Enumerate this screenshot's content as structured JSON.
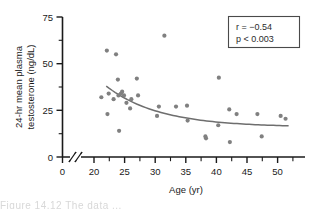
{
  "figure": {
    "background_color": "#ffffff",
    "axis_color": "#1a1a1a",
    "marker_color": "#808080",
    "curve_color": "#6e6e6e",
    "caption_fragment": "Figure  14.12   The data ..."
  },
  "annotation": {
    "name": "stats-box",
    "line1": "r = −0.54",
    "line2": "p < 0.003",
    "r_value": -0.54,
    "p_text": "< 0.003"
  },
  "chart_data": {
    "type": "scatter",
    "title": "",
    "xlabel": "Age (yr)",
    "ylabel": "24-hr mean plasma testosterone (ng/dL)",
    "ylabel_line1": "24-hr mean plasma",
    "ylabel_line2": "testosterone (ng/dL)",
    "xlim": [
      19,
      53
    ],
    "ylim": [
      0,
      75
    ],
    "xticks": [
      20,
      25,
      30,
      35,
      40,
      45,
      50
    ],
    "xtick_labels": [
      "20",
      "25",
      "30",
      "35",
      "40",
      "45",
      "50"
    ],
    "x_origin_label": "0",
    "x_axis_break": true,
    "yticks": [
      0,
      25,
      50,
      75
    ],
    "ytick_labels": [
      "0",
      "25",
      "50",
      "75"
    ],
    "y_minor_ticks": [
      12.5,
      37.5,
      62.5
    ],
    "grid": false,
    "legend": "none",
    "points": [
      [
        21.2,
        32
      ],
      [
        22.1,
        57
      ],
      [
        22.2,
        23
      ],
      [
        22.4,
        34
      ],
      [
        23.2,
        31
      ],
      [
        23.6,
        55
      ],
      [
        23.9,
        41.5
      ],
      [
        24.0,
        33
      ],
      [
        24.1,
        14
      ],
      [
        24.4,
        34
      ],
      [
        24.6,
        35
      ],
      [
        24.9,
        33
      ],
      [
        25.3,
        29
      ],
      [
        25.9,
        26
      ],
      [
        26.1,
        31
      ],
      [
        27.0,
        42
      ],
      [
        27.2,
        33
      ],
      [
        30.3,
        22
      ],
      [
        30.6,
        27
      ],
      [
        31.5,
        65
      ],
      [
        33.4,
        27
      ],
      [
        35.2,
        27.5
      ],
      [
        35.3,
        19.5
      ],
      [
        38.2,
        11
      ],
      [
        38.3,
        10
      ],
      [
        40.3,
        17
      ],
      [
        40.4,
        42.5
      ],
      [
        42.1,
        25.5
      ],
      [
        42.2,
        8
      ],
      [
        43.3,
        23
      ],
      [
        46.7,
        23
      ],
      [
        47.4,
        11
      ],
      [
        50.5,
        22
      ],
      [
        51.3,
        20.5
      ]
    ],
    "fit_curve": {
      "description": "decreasing exponential-like trend line",
      "x_start": 22.0,
      "x_end": 51.8,
      "y_start": 38.0,
      "y_end": 16.0
    }
  }
}
